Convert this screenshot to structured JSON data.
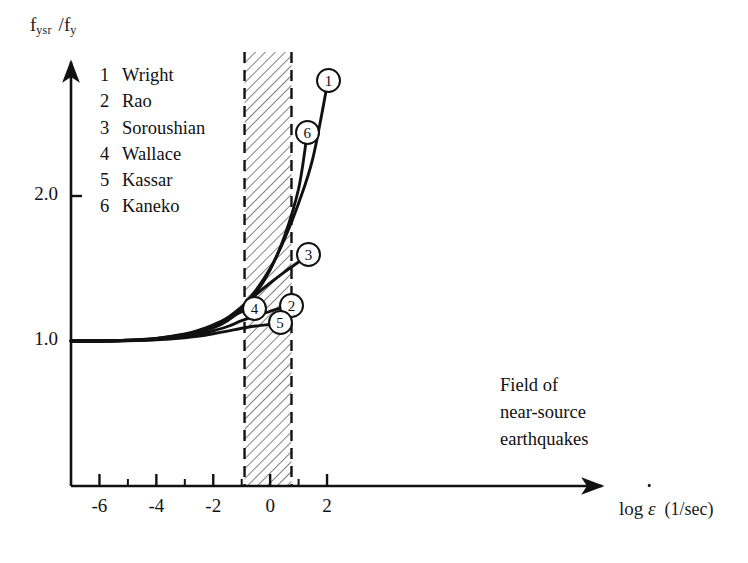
{
  "figure": {
    "ylabel_main": "f",
    "ylabel_sub1": "ysr",
    "ylabel_slash": "/f",
    "ylabel_sub2": "y",
    "xlabel_log": "log",
    "xlabel_sym": "ε",
    "xlabel_unit": "(1/sec)",
    "field_note_l1": "Field of",
    "field_note_l2": "near-source",
    "field_note_l3": "earthquakes",
    "band_fill": "#ffffff",
    "band_hatch_color": "#555555",
    "axis_color": "#111111",
    "curve_color": "#111111"
  },
  "legend": {
    "entries": [
      {
        "num": "1",
        "name": "Wright"
      },
      {
        "num": "2",
        "name": "Rao"
      },
      {
        "num": "3",
        "name": "Soroushian"
      },
      {
        "num": "4",
        "name": "Wallace"
      },
      {
        "num": "5",
        "name": "Kassar"
      },
      {
        "num": "6",
        "name": "Kaneko"
      }
    ]
  },
  "markers": [
    {
      "num": "1"
    },
    {
      "num": "2"
    },
    {
      "num": "3"
    },
    {
      "num": "4"
    },
    {
      "num": "5"
    },
    {
      "num": "6"
    }
  ],
  "axes": {
    "x_ticks_labeled": [
      "-6",
      "-4",
      "-2",
      "0",
      "2"
    ],
    "y_ticks_labeled": [
      "2.0",
      "1.0"
    ]
  },
  "chart_data": {
    "type": "line",
    "title": "",
    "xlabel": "log ε̇ (1/sec)",
    "ylabel": "f_ysr / f_y",
    "xlim": [
      -7.0,
      2.7
    ],
    "ylim": [
      0.72,
      2.95
    ],
    "xticks": [
      -7,
      -6,
      -5,
      -4,
      -3,
      -2,
      -1,
      0,
      1,
      2
    ],
    "xticklabels": [
      "",
      "-6",
      "",
      "-4",
      "",
      "-2",
      "",
      "0",
      "",
      "2"
    ],
    "yticks": [
      1.0,
      2.0
    ],
    "yticklabels": [
      "1.0",
      "2.0"
    ],
    "grid": false,
    "legend_position": "upper-left-inside",
    "annotations": [
      {
        "text": "Field of near-source earthquakes",
        "x": 1.1,
        "y": 0.88,
        "kind": "text"
      },
      {
        "kind": "hatched-band",
        "label": "field of near-source earthquakes",
        "x_start": -0.9,
        "x_end": 0.75,
        "y_start": 0.72,
        "y_end": 2.95,
        "hatch": "diagonal-45",
        "border": "dashed"
      }
    ],
    "series": [
      {
        "name": "Wright",
        "num": "1",
        "marker_label": "1",
        "marker_x": 2.05,
        "marker_y": 2.8,
        "points": [
          [
            -7.0,
            1.0
          ],
          [
            -6.0,
            1.0
          ],
          [
            -5.0,
            1.005
          ],
          [
            -4.0,
            1.015
          ],
          [
            -3.0,
            1.04
          ],
          [
            -2.5,
            1.065
          ],
          [
            -2.0,
            1.1
          ],
          [
            -1.5,
            1.155
          ],
          [
            -1.0,
            1.235
          ],
          [
            -0.5,
            1.35
          ],
          [
            0.0,
            1.5
          ],
          [
            0.5,
            1.7
          ],
          [
            1.0,
            1.95
          ],
          [
            1.5,
            2.26
          ],
          [
            2.0,
            2.76
          ]
        ]
      },
      {
        "name": "Rao",
        "num": "2",
        "marker_label": "2",
        "marker_x": 0.75,
        "marker_y": 1.245,
        "points": [
          [
            -7.0,
            1.0
          ],
          [
            -6.0,
            1.0
          ],
          [
            -5.0,
            1.003
          ],
          [
            -4.0,
            1.01
          ],
          [
            -3.0,
            1.03
          ],
          [
            -2.5,
            1.045
          ],
          [
            -2.0,
            1.07
          ],
          [
            -1.5,
            1.1
          ],
          [
            -1.0,
            1.14
          ],
          [
            -0.5,
            1.175
          ],
          [
            0.0,
            1.205
          ],
          [
            0.4,
            1.228
          ],
          [
            0.72,
            1.243
          ]
        ]
      },
      {
        "name": "Soroushian",
        "num": "3",
        "marker_label": "3",
        "marker_x": 1.35,
        "marker_y": 1.6,
        "points": [
          [
            -7.0,
            1.0
          ],
          [
            -6.0,
            1.0
          ],
          [
            -5.0,
            1.005
          ],
          [
            -4.0,
            1.017
          ],
          [
            -3.0,
            1.045
          ],
          [
            -2.5,
            1.07
          ],
          [
            -2.0,
            1.105
          ],
          [
            -1.5,
            1.16
          ],
          [
            -1.0,
            1.235
          ],
          [
            -0.5,
            1.32
          ],
          [
            0.0,
            1.4
          ],
          [
            0.5,
            1.475
          ],
          [
            1.0,
            1.545
          ],
          [
            1.3,
            1.585
          ]
        ]
      },
      {
        "name": "Wallace",
        "num": "4",
        "marker_label": "4",
        "marker_x": -0.55,
        "marker_y": 1.225,
        "points": [
          [
            -7.0,
            1.0
          ],
          [
            -6.0,
            1.0
          ],
          [
            -5.0,
            1.005
          ],
          [
            -4.0,
            1.018
          ],
          [
            -3.0,
            1.048
          ],
          [
            -2.5,
            1.075
          ],
          [
            -2.0,
            1.112
          ],
          [
            -1.5,
            1.155
          ],
          [
            -1.0,
            1.2
          ],
          [
            -0.6,
            1.222
          ]
        ]
      },
      {
        "name": "Kassar",
        "num": "5",
        "marker_label": "5",
        "marker_x": 0.35,
        "marker_y": 1.125,
        "points": [
          [
            -7.0,
            1.0
          ],
          [
            -6.0,
            1.0
          ],
          [
            -5.0,
            1.002
          ],
          [
            -4.0,
            1.008
          ],
          [
            -3.0,
            1.022
          ],
          [
            -2.5,
            1.034
          ],
          [
            -2.0,
            1.05
          ],
          [
            -1.5,
            1.068
          ],
          [
            -1.0,
            1.088
          ],
          [
            -0.5,
            1.103
          ],
          [
            0.0,
            1.115
          ],
          [
            0.32,
            1.122
          ]
        ]
      },
      {
        "name": "Kaneko",
        "num": "6",
        "marker_label": "6",
        "marker_x": 1.3,
        "marker_y": 2.44,
        "points": [
          [
            -7.0,
            1.0
          ],
          [
            -6.0,
            1.0
          ],
          [
            -5.0,
            1.004
          ],
          [
            -4.0,
            1.013
          ],
          [
            -3.0,
            1.036
          ],
          [
            -2.5,
            1.058
          ],
          [
            -2.0,
            1.09
          ],
          [
            -1.5,
            1.14
          ],
          [
            -1.0,
            1.215
          ],
          [
            -0.5,
            1.33
          ],
          [
            0.0,
            1.49
          ],
          [
            0.5,
            1.72
          ],
          [
            1.0,
            2.05
          ],
          [
            1.28,
            2.4
          ]
        ]
      }
    ]
  }
}
